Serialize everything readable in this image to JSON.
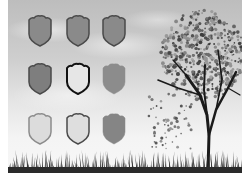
{
  "scene": {
    "description": "Grayscale illustration: 3x3 grid of shield icons over a cloudy sky, tree on the right, grass along the bottom",
    "background_top": "#bdbdbd",
    "background_bottom": "#f7f7f7"
  },
  "shields": [
    {
      "row": 0,
      "col": 0,
      "x": 26,
      "y": 14,
      "fill": "#8a8a8a",
      "stroke": "#4a4a4a",
      "stroke_width": 1.5
    },
    {
      "row": 0,
      "col": 1,
      "x": 64,
      "y": 14,
      "fill": "#8a8a8a",
      "stroke": "#4a4a4a",
      "stroke_width": 1.5
    },
    {
      "row": 0,
      "col": 2,
      "x": 100,
      "y": 14,
      "fill": "#8a8a8a",
      "stroke": "#4a4a4a",
      "stroke_width": 1.5
    },
    {
      "row": 1,
      "col": 0,
      "x": 26,
      "y": 62,
      "fill": "#7e7e7e",
      "stroke": "#4a4a4a",
      "stroke_width": 1.5
    },
    {
      "row": 1,
      "col": 1,
      "x": 64,
      "y": 62,
      "fill": "#e6e6e6",
      "stroke": "#111111",
      "stroke_width": 2
    },
    {
      "row": 1,
      "col": 2,
      "x": 100,
      "y": 62,
      "fill": "#8c8c8c",
      "stroke": "#8c8c8c",
      "stroke_width": 0.5
    },
    {
      "row": 2,
      "col": 0,
      "x": 26,
      "y": 112,
      "fill": "#dcdcdc",
      "stroke": "#8c8c8c",
      "stroke_width": 1.5
    },
    {
      "row": 2,
      "col": 1,
      "x": 64,
      "y": 112,
      "fill": "#dedede",
      "stroke": "#4a4a4a",
      "stroke_width": 1.5
    },
    {
      "row": 2,
      "col": 2,
      "x": 100,
      "y": 112,
      "fill": "#858585",
      "stroke": "#858585",
      "stroke_width": 0.5
    }
  ],
  "tree": {
    "trunk_color": "#1a1a1a",
    "leaf_color": "#5a5a5a"
  },
  "grass": {
    "color": "#2e2e2e"
  }
}
